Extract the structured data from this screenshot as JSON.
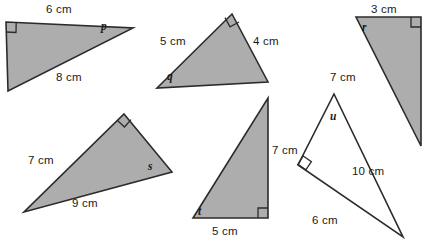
{
  "figure": {
    "background_color": "#ffffff",
    "fill_color": "#adadad",
    "open_fill_color": "#ffffff",
    "stroke_color": "#2b2b2b",
    "width": 430,
    "height": 246
  },
  "triangles": [
    {
      "id": "triangle-1",
      "fill": "shaded",
      "right_angle_corner": "top-left",
      "angle_label": "p",
      "side_labels": [
        "6 cm",
        "8 cm"
      ]
    },
    {
      "id": "triangle-2",
      "fill": "shaded",
      "right_angle_corner": "top-right",
      "angle_label": "q",
      "side_labels": [
        "5 cm",
        "4 cm"
      ]
    },
    {
      "id": "triangle-3",
      "fill": "shaded",
      "right_angle_corner": "top-right",
      "angle_label": "r",
      "side_labels": [
        "3 cm",
        "7 cm"
      ]
    },
    {
      "id": "triangle-4",
      "fill": "shaded",
      "right_angle_corner": "top",
      "angle_label": "s",
      "side_labels": [
        "7 cm",
        "9 cm"
      ]
    },
    {
      "id": "triangle-5",
      "fill": "shaded",
      "right_angle_corner": "bottom-right",
      "angle_label": "t",
      "side_labels": [
        "7 cm",
        "5 cm"
      ]
    },
    {
      "id": "triangle-6",
      "fill": "open",
      "right_angle_corner": "left",
      "angle_label": "u",
      "side_labels": [
        "10 cm",
        "6 cm"
      ]
    }
  ],
  "labels": {
    "t1_side_top": "6 cm",
    "t1_side_hyp": "8 cm",
    "t1_angle": "p",
    "t2_side_left": "5 cm",
    "t2_side_right": "4 cm",
    "t2_angle": "q",
    "t3_side_top": "3 cm",
    "t3_side_left": "7 cm",
    "t3_angle": "r",
    "t4_side_left": "7 cm",
    "t4_side_base": "9 cm",
    "t4_angle": "s",
    "t5_side_right": "7 cm",
    "t5_side_base": "5 cm",
    "t5_angle": "t",
    "t6_side_right": "10 cm",
    "t6_side_base": "6 cm",
    "t6_angle": "u"
  }
}
